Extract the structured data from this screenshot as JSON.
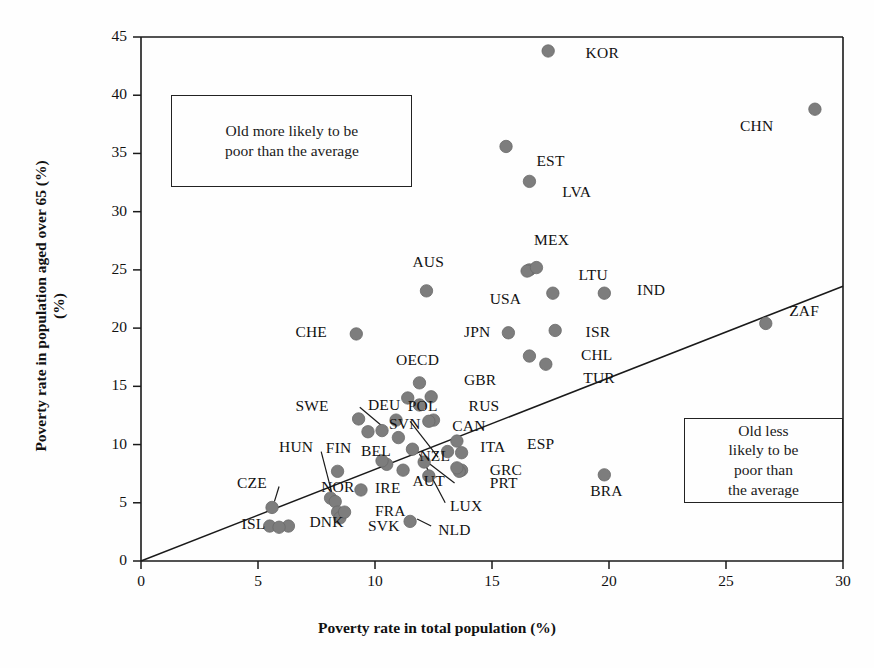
{
  "chart_data": {
    "type": "scatter",
    "title": "",
    "xlabel": "Poverty rate in total population (%)",
    "ylabel": "Poverty rate in population aged over 65 (%)",
    "xlim": [
      0,
      30
    ],
    "ylim": [
      0,
      45
    ],
    "xticks": [
      0,
      5,
      10,
      15,
      20,
      25,
      30
    ],
    "yticks": [
      0,
      5,
      10,
      15,
      20,
      25,
      30,
      35,
      40,
      45
    ],
    "grid": false,
    "legend": "none",
    "marker_color": "#7d7d7d",
    "line_color": "#1a1a1a",
    "reference_line": {
      "label": "45-degree equality line",
      "x": [
        0,
        30
      ],
      "y": [
        0,
        23.6
      ]
    },
    "annotations": [
      {
        "id": "note-upper",
        "text": "Old more likely to be poor than the average",
        "lines": [
          "Old more likely to be",
          "poor than the average"
        ],
        "box": {
          "x0": 1.3,
          "x1": 11.6,
          "y0": 32.1,
          "y1": 40.0
        }
      },
      {
        "id": "note-lower",
        "text": "Old less likely to be poor than the average",
        "lines": [
          "Old less",
          "likely to be",
          "poor than",
          "the average"
        ],
        "box": {
          "x0": 23.2,
          "x1": 30.0,
          "y0": 5.0,
          "y1": 12.3
        }
      }
    ],
    "points": [
      {
        "code": "KOR",
        "x": 17.4,
        "y": 43.8,
        "lx": 19.0,
        "ly": 43.5,
        "leader": null
      },
      {
        "code": "CHN",
        "x": 28.8,
        "y": 38.8,
        "lx": 25.6,
        "ly": 37.3,
        "leader": null
      },
      {
        "code": "EST",
        "x": 15.6,
        "y": 35.6,
        "lx": 16.9,
        "ly": 34.3,
        "leader": null
      },
      {
        "code": "LVA",
        "x": 16.6,
        "y": 32.6,
        "lx": 18.0,
        "ly": 31.6,
        "leader": null
      },
      {
        "code": "MEX",
        "x": 16.6,
        "y": 25.0,
        "lx": 16.8,
        "ly": 27.5,
        "leader": null
      },
      {
        "code": "LTU",
        "x": 17.6,
        "y": 23.0,
        "lx": 18.7,
        "ly": 24.5,
        "leader": null
      },
      {
        "code": "IND",
        "x": 19.8,
        "y": 23.0,
        "lx": 21.2,
        "ly": 23.2,
        "leader": null
      },
      {
        "code": "USA",
        "x": 16.5,
        "y": 24.9,
        "lx": 14.9,
        "ly": 22.4,
        "leader": null
      },
      {
        "code": "AUS",
        "x": 12.2,
        "y": 23.2,
        "lx": 11.6,
        "ly": 25.6,
        "leader": null
      },
      {
        "code": "ZAF",
        "x": 26.7,
        "y": 20.4,
        "lx": 27.7,
        "ly": 21.4,
        "leader": null
      },
      {
        "code": "ISR",
        "x": 17.7,
        "y": 19.8,
        "lx": 19.0,
        "ly": 19.6,
        "leader": null
      },
      {
        "code": "JPN",
        "x": 15.7,
        "y": 19.6,
        "lx": 13.8,
        "ly": 19.6,
        "leader": null
      },
      {
        "code": "CHE",
        "x": 9.2,
        "y": 19.5,
        "lx": 6.6,
        "ly": 19.6,
        "leader": null
      },
      {
        "code": "CHL",
        "x": 16.6,
        "y": 17.6,
        "lx": 18.8,
        "ly": 17.6,
        "leader": null
      },
      {
        "code": "TUR",
        "x": 17.3,
        "y": 16.9,
        "lx": 18.9,
        "ly": 15.6,
        "leader": null
      },
      {
        "code": "OECD",
        "x": 11.9,
        "y": 15.3,
        "lx": 10.9,
        "ly": 17.2,
        "leader": null
      },
      {
        "code": "GBR",
        "x": 12.4,
        "y": 14.1,
        "lx": 13.8,
        "ly": 15.5,
        "leader": null
      },
      {
        "code": "RUS",
        "x": 12.5,
        "y": 12.1,
        "lx": 14.0,
        "ly": 13.2,
        "leader": null
      },
      {
        "code": "POL",
        "x": 11.9,
        "y": 13.4,
        "lx": 11.4,
        "ly": 13.2,
        "leader": null
      },
      {
        "code": "DEU",
        "x": 10.3,
        "y": 11.2,
        "lx": 9.7,
        "ly": 13.3,
        "leader": {
          "x1": 9.35,
          "y1": 13.2,
          "x2": 10.3,
          "y2": 11.6
        }
      },
      {
        "code": "SWE",
        "x": 9.3,
        "y": 12.2,
        "lx": 6.6,
        "ly": 13.2,
        "leader": null
      },
      {
        "code": "SVN",
        "x": 11.0,
        "y": 10.6,
        "lx": 10.6,
        "ly": 11.7,
        "leader": null
      },
      {
        "code": "CAN",
        "x": 13.5,
        "y": 10.3,
        "lx": 13.3,
        "ly": 11.5,
        "leader": null
      },
      {
        "code": "ITA",
        "x": 13.7,
        "y": 9.3,
        "lx": 14.5,
        "ly": 9.7,
        "leader": null
      },
      {
        "code": "BEL",
        "x": 10.5,
        "y": 8.3,
        "lx": 9.4,
        "ly": 9.4,
        "leader": null
      },
      {
        "code": "NZL",
        "x": 12.1,
        "y": 8.5,
        "lx": 11.9,
        "ly": 8.9,
        "leader": {
          "x1": 12.7,
          "y1": 8.9,
          "x2": 11.5,
          "y2": 12.0
        }
      },
      {
        "code": "HUN",
        "x": 8.4,
        "y": 7.7,
        "lx": 5.9,
        "ly": 9.7,
        "leader": null
      },
      {
        "code": "FIN",
        "x": 8.1,
        "y": 5.4,
        "lx": 7.9,
        "ly": 9.6,
        "leader": {
          "x1": 7.7,
          "y1": 9.4,
          "x2": 8.15,
          "y2": 5.9
        }
      },
      {
        "code": "GRC",
        "x": 13.7,
        "y": 7.8,
        "lx": 14.9,
        "ly": 7.7,
        "leader": null
      },
      {
        "code": "PRT",
        "x": 13.6,
        "y": 7.7,
        "lx": 14.9,
        "ly": 6.6,
        "leader": null
      },
      {
        "code": "ESP",
        "x": 13.5,
        "y": 8.0,
        "lx": 16.5,
        "ly": 10.0,
        "leader": null
      },
      {
        "code": "BRA",
        "x": 19.8,
        "y": 7.4,
        "lx": 19.2,
        "ly": 5.9,
        "leader": null
      },
      {
        "code": "AUT",
        "x": 11.2,
        "y": 7.8,
        "lx": 11.6,
        "ly": 6.8,
        "leader": {
          "x1": 13.4,
          "y1": 6.7,
          "x2": 12.3,
          "y2": 8.4
        }
      },
      {
        "code": "IRE",
        "x": 9.4,
        "y": 6.1,
        "lx": 10.0,
        "ly": 6.2,
        "leader": null
      },
      {
        "code": "LUX",
        "x": 11.6,
        "y": 9.6,
        "lx": 13.2,
        "ly": 4.6,
        "leader": {
          "x1": 13.0,
          "y1": 5.0,
          "x2": 11.9,
          "y2": 9.2
        }
      },
      {
        "code": "CZE",
        "x": 5.6,
        "y": 4.6,
        "lx": 4.1,
        "ly": 6.6,
        "leader": {
          "x1": 5.9,
          "y1": 6.4,
          "x2": 5.7,
          "y2": 5.1
        }
      },
      {
        "code": "NOR",
        "x": 8.3,
        "y": 5.1,
        "lx": 7.7,
        "ly": 6.3,
        "leader": null
      },
      {
        "code": "DNK",
        "x": 6.3,
        "y": 3.0,
        "lx": 7.2,
        "ly": 3.3,
        "leader": null
      },
      {
        "code": "ISL",
        "x": 5.5,
        "y": 3.0,
        "lx": 4.3,
        "ly": 3.1,
        "leader": null
      },
      {
        "code": "SVK",
        "x": 8.4,
        "y": 4.2,
        "lx": 9.7,
        "ly": 2.9,
        "leader": null
      },
      {
        "code": "FRA",
        "x": 8.5,
        "y": 3.7,
        "lx": 10.0,
        "ly": 4.2,
        "leader": null
      },
      {
        "code": "NLD",
        "x": 11.5,
        "y": 3.4,
        "lx": 12.7,
        "ly": 2.6,
        "leader": {
          "x1": 12.4,
          "y1": 3.0,
          "x2": 11.8,
          "y2": 3.6
        }
      }
    ],
    "extra_markers": [
      {
        "x": 16.9,
        "y": 25.2
      },
      {
        "x": 5.9,
        "y": 2.9
      },
      {
        "x": 10.9,
        "y": 12.1
      },
      {
        "x": 9.7,
        "y": 11.1
      },
      {
        "x": 12.3,
        "y": 12.0
      },
      {
        "x": 11.4,
        "y": 14.0
      },
      {
        "x": 10.3,
        "y": 8.6
      },
      {
        "x": 13.1,
        "y": 9.4
      },
      {
        "x": 8.7,
        "y": 4.2
      },
      {
        "x": 12.3,
        "y": 7.3
      }
    ]
  }
}
